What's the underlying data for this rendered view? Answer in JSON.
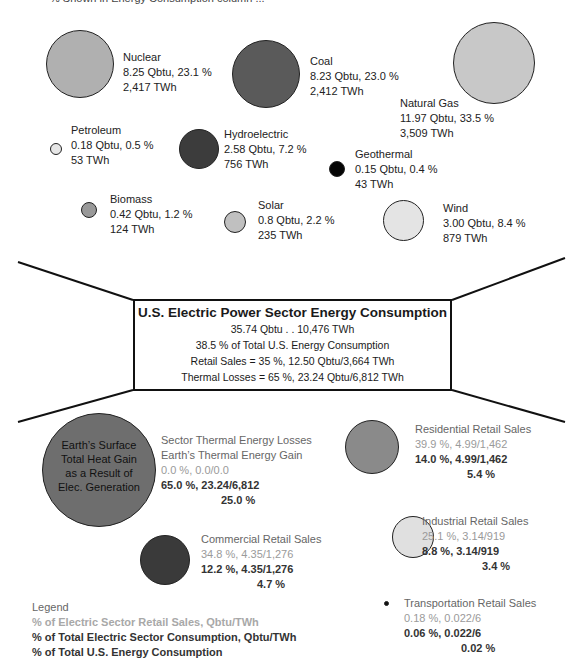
{
  "header": {
    "clipped_caption": "% Shown in Energy Consumption column ... "
  },
  "sources": [
    {
      "name": "Nuclear",
      "qbtu": "8.25 Qbtu, 23.1 %",
      "twh": "2,417 TWh",
      "color": "#b0b0b0"
    },
    {
      "name": "Coal",
      "qbtu": "8.23 Qbtu, 23.0 %",
      "twh": "2,412 TWh",
      "color": "#5a5a5a"
    },
    {
      "name": "Natural Gas",
      "qbtu": "11.97 Qbtu, 33.5 %",
      "twh": "3,509 TWh",
      "color": "#c8c8c8"
    },
    {
      "name": "Petroleum",
      "qbtu": "0.18 Qbtu, 0.5 %",
      "twh": "53 TWh",
      "color": "#e6e6e6"
    },
    {
      "name": "Hydroelectric",
      "qbtu": "2.58 Qbtu, 7.2 %",
      "twh": "756 TWh",
      "color": "#3c3c3c"
    },
    {
      "name": "Geothermal",
      "qbtu": "0.15 Qbtu, 0.4 %",
      "twh": "43 TWh",
      "color": "#050505"
    },
    {
      "name": "Biomass",
      "qbtu": "0.42 Qbtu, 1.2 %",
      "twh": "124 TWh",
      "color": "#999999"
    },
    {
      "name": "Solar",
      "qbtu": "0.8 Qbtu, 2.2 %",
      "twh": "235 TWh",
      "color": "#c0c0c0"
    },
    {
      "name": "Wind",
      "qbtu": "3.00 Qbtu, 8.4 %",
      "twh": "879 TWh",
      "color": "#e4e4e4"
    }
  ],
  "center_box": {
    "title": "U.S. Electric Power Sector Energy Consumption",
    "line1": "35.74 Qbtu . . 10,476 TWh",
    "line2": "38.5 % of Total U.S. Energy Consumption",
    "line3": "Retail Sales = 35 %, 12.50 Qbtu/3,664 TWh",
    "line4": "Thermal Losses = 65 %, 23.24 Qbtu/6,812 TWh"
  },
  "outputs": {
    "earth": {
      "circle_text": [
        "Earth’s Surface",
        "Total Heat Gain",
        "as a Result of",
        "Elec. Generation"
      ],
      "title1": "Sector Thermal Energy Losses",
      "title2": "Earth’s Thermal Energy Gain",
      "retail": "0.0 %, 0.0/0.0",
      "sector": "65.0 %, 23.24/6,812",
      "total": "25.0 %",
      "color": "#6e6e6e"
    },
    "residential": {
      "title": "Residential Retail Sales",
      "retail": "39.9 %, 4.99/1,462",
      "sector": "14.0 %, 4.99/1,462",
      "total": "5.4 %",
      "color": "#8a8a8a"
    },
    "commercial": {
      "title": "Commercial Retail Sales",
      "retail": "34.8 %, 4.35/1,276",
      "sector": "12.2 %, 4.35/1,276",
      "total": "4.7 %",
      "color": "#3a3a3a"
    },
    "industrial": {
      "title": "Industrial Retail Sales",
      "retail": "25.1 %, 3.14/919",
      "sector": "8.8 %, 3.14/919",
      "total": "3.4 %",
      "color": "#e0e0e0"
    },
    "transportation": {
      "title": "Transportation Retail Sales",
      "retail": "0.18 %, 0.022/6",
      "sector": "0.06 %, 0.022/6",
      "total": "0.02 %",
      "color": "#111111"
    }
  },
  "legend": {
    "title": "Legend",
    "item1": "% of Electric Sector Retail Sales, Qbtu/TWh",
    "item2": "% of Total Electric Sector Consumption, Qbtu/TWh",
    "item3": "% of Total U.S. Energy Consumption"
  }
}
